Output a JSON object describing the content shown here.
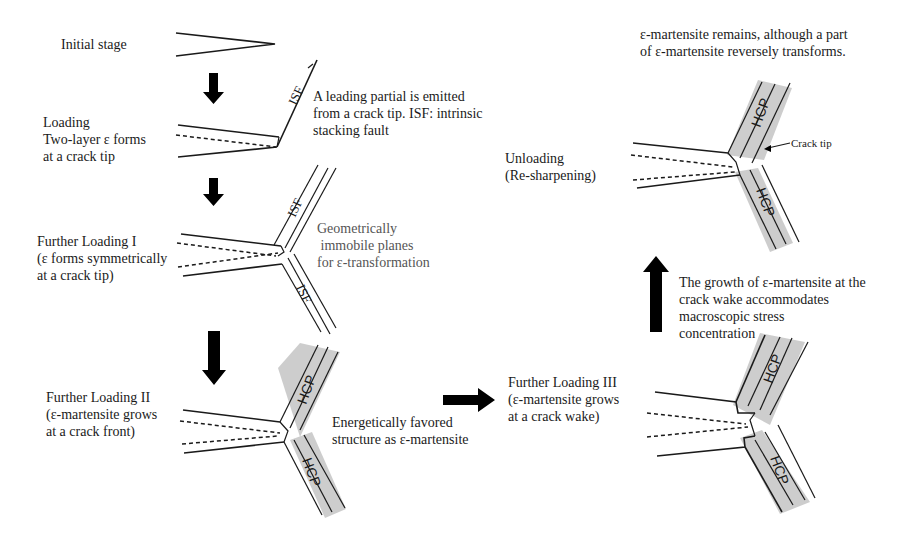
{
  "figure": {
    "stages": [
      {
        "id": "initial",
        "lines": [
          "Initial stage"
        ]
      },
      {
        "id": "loading",
        "lines": [
          "Loading",
          "Two-layer ε forms",
          "at a crack tip"
        ]
      },
      {
        "id": "further-loading-1",
        "lines": [
          "Further Loading I",
          "(ε forms symmetrically",
          "at a crack tip)"
        ]
      },
      {
        "id": "further-loading-2",
        "lines": [
          "Further Loading II",
          "(ε-martensite grows",
          "at a crack front)"
        ]
      },
      {
        "id": "further-loading-3",
        "lines": [
          "Further Loading III",
          "(ε-martensite grows",
          "at a crack wake)"
        ]
      },
      {
        "id": "unloading",
        "lines": [
          "Unloading",
          "(Re-sharpening)"
        ]
      }
    ],
    "annotations": {
      "leading_partial": [
        "A leading partial is emitted",
        "from a crack tip. ISF: intrinsic",
        "stacking fault"
      ],
      "immobile_planes": [
        "Geometrically",
        " immobile planes",
        "for ε-transformation"
      ],
      "energetically_favored": [
        "Energetically favored",
        "structure as ε-martensite"
      ],
      "crack_wake_growth": [
        "The growth of ε-martensite at the",
        "crack wake accommodates",
        "macroscopic stress",
        "concentration"
      ],
      "martensite_remains": [
        "ε-martensite remains, although a part",
        "of ε-martensite reversely transforms."
      ],
      "crack_tip": "Crack tip"
    },
    "band_labels": {
      "isf": "ISF",
      "hcp": "HCP"
    },
    "colors": {
      "line": "#1a1a1a",
      "band": "#c8c8c8",
      "gray_text": "#555555",
      "arrow": "#000000"
    }
  }
}
